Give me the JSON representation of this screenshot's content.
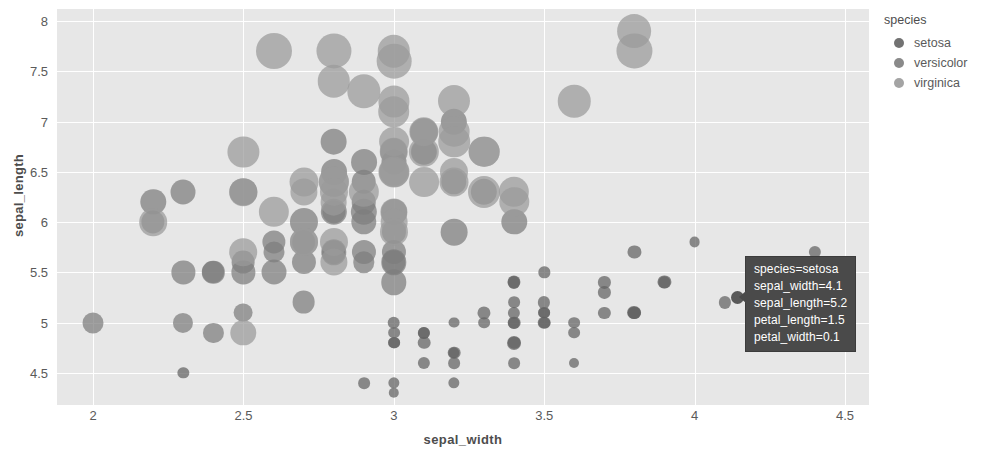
{
  "chart_data": {
    "type": "scatter",
    "title": "",
    "xlabel": "sepal_width",
    "ylabel": "sepal_length",
    "xlim": [
      1.88,
      4.58
    ],
    "ylim": [
      4.18,
      8.12
    ],
    "xticks": [
      "2",
      "2.5",
      "3",
      "3.5",
      "4",
      "4.5"
    ],
    "xtick_values": [
      2,
      2.5,
      3,
      3.5,
      4,
      4.5
    ],
    "yticks": [
      "4.5",
      "5",
      "5.5",
      "6",
      "6.5",
      "7",
      "7.5",
      "8"
    ],
    "ytick_values": [
      4.5,
      5,
      5.5,
      6,
      6.5,
      7,
      7.5,
      8
    ],
    "grid": true,
    "legend_position": "right",
    "size_field": "petal_length",
    "color_field": "species",
    "plot_bgcolor": "#e7e7e7",
    "gridcolor": "#ffffff",
    "series": [
      {
        "name": "setosa",
        "color": "#636363",
        "points": [
          {
            "x": 3.5,
            "y": 5.1,
            "s": 1.4
          },
          {
            "x": 3.0,
            "y": 4.9,
            "s": 1.4
          },
          {
            "x": 3.2,
            "y": 4.7,
            "s": 1.3
          },
          {
            "x": 3.1,
            "y": 4.6,
            "s": 1.5
          },
          {
            "x": 3.6,
            "y": 5.0,
            "s": 1.4
          },
          {
            "x": 3.9,
            "y": 5.4,
            "s": 1.7
          },
          {
            "x": 3.4,
            "y": 4.6,
            "s": 1.4
          },
          {
            "x": 3.4,
            "y": 5.0,
            "s": 1.5
          },
          {
            "x": 2.9,
            "y": 4.4,
            "s": 1.4
          },
          {
            "x": 3.1,
            "y": 4.9,
            "s": 1.5
          },
          {
            "x": 3.7,
            "y": 5.4,
            "s": 1.5
          },
          {
            "x": 3.4,
            "y": 4.8,
            "s": 1.6
          },
          {
            "x": 3.0,
            "y": 4.8,
            "s": 1.4
          },
          {
            "x": 3.0,
            "y": 4.3,
            "s": 1.1
          },
          {
            "x": 4.0,
            "y": 5.8,
            "s": 1.2
          },
          {
            "x": 4.4,
            "y": 5.7,
            "s": 1.5
          },
          {
            "x": 3.9,
            "y": 5.4,
            "s": 1.3
          },
          {
            "x": 3.5,
            "y": 5.1,
            "s": 1.4
          },
          {
            "x": 3.8,
            "y": 5.7,
            "s": 1.7
          },
          {
            "x": 3.8,
            "y": 5.1,
            "s": 1.5
          },
          {
            "x": 3.4,
            "y": 5.4,
            "s": 1.7
          },
          {
            "x": 3.7,
            "y": 5.1,
            "s": 1.5
          },
          {
            "x": 3.6,
            "y": 4.6,
            "s": 1.0
          },
          {
            "x": 3.3,
            "y": 5.1,
            "s": 1.7
          },
          {
            "x": 3.4,
            "y": 4.8,
            "s": 1.9
          },
          {
            "x": 3.0,
            "y": 5.0,
            "s": 1.6
          },
          {
            "x": 3.4,
            "y": 5.0,
            "s": 1.6
          },
          {
            "x": 3.5,
            "y": 5.2,
            "s": 1.5
          },
          {
            "x": 3.4,
            "y": 5.2,
            "s": 1.4
          },
          {
            "x": 3.2,
            "y": 4.7,
            "s": 1.6
          },
          {
            "x": 3.1,
            "y": 4.8,
            "s": 1.6
          },
          {
            "x": 3.4,
            "y": 5.4,
            "s": 1.5
          },
          {
            "x": 4.1,
            "y": 5.2,
            "s": 1.5
          },
          {
            "x": 4.2,
            "y": 5.5,
            "s": 1.4
          },
          {
            "x": 3.1,
            "y": 4.9,
            "s": 1.5
          },
          {
            "x": 3.2,
            "y": 5.0,
            "s": 1.2
          },
          {
            "x": 3.5,
            "y": 5.5,
            "s": 1.3
          },
          {
            "x": 3.6,
            "y": 4.9,
            "s": 1.4
          },
          {
            "x": 3.0,
            "y": 4.4,
            "s": 1.3
          },
          {
            "x": 3.4,
            "y": 5.1,
            "s": 1.5
          },
          {
            "x": 3.5,
            "y": 5.0,
            "s": 1.3
          },
          {
            "x": 2.3,
            "y": 4.5,
            "s": 1.3
          },
          {
            "x": 3.2,
            "y": 4.4,
            "s": 1.3
          },
          {
            "x": 3.5,
            "y": 5.0,
            "s": 1.6
          },
          {
            "x": 3.8,
            "y": 5.1,
            "s": 1.9
          },
          {
            "x": 3.0,
            "y": 4.8,
            "s": 1.4
          },
          {
            "x": 3.8,
            "y": 5.1,
            "s": 1.6
          },
          {
            "x": 3.2,
            "y": 4.6,
            "s": 1.4
          },
          {
            "x": 3.7,
            "y": 5.3,
            "s": 1.5
          },
          {
            "x": 3.3,
            "y": 5.0,
            "s": 1.4
          }
        ]
      },
      {
        "name": "versicolor",
        "color": "#7d7d7d",
        "points": [
          {
            "x": 3.2,
            "y": 7.0,
            "s": 4.7
          },
          {
            "x": 3.2,
            "y": 6.4,
            "s": 4.5
          },
          {
            "x": 3.1,
            "y": 6.9,
            "s": 4.9
          },
          {
            "x": 2.3,
            "y": 5.5,
            "s": 4.0
          },
          {
            "x": 2.8,
            "y": 6.5,
            "s": 4.6
          },
          {
            "x": 2.8,
            "y": 5.7,
            "s": 4.5
          },
          {
            "x": 3.3,
            "y": 6.3,
            "s": 4.7
          },
          {
            "x": 2.4,
            "y": 4.9,
            "s": 3.3
          },
          {
            "x": 2.9,
            "y": 6.6,
            "s": 4.6
          },
          {
            "x": 2.7,
            "y": 5.2,
            "s": 3.9
          },
          {
            "x": 2.0,
            "y": 5.0,
            "s": 3.5
          },
          {
            "x": 3.0,
            "y": 5.9,
            "s": 4.2
          },
          {
            "x": 2.2,
            "y": 6.0,
            "s": 4.0
          },
          {
            "x": 2.9,
            "y": 6.1,
            "s": 4.7
          },
          {
            "x": 2.9,
            "y": 5.6,
            "s": 3.6
          },
          {
            "x": 3.1,
            "y": 6.7,
            "s": 4.4
          },
          {
            "x": 3.0,
            "y": 5.6,
            "s": 4.5
          },
          {
            "x": 2.7,
            "y": 5.8,
            "s": 4.1
          },
          {
            "x": 2.2,
            "y": 6.2,
            "s": 4.5
          },
          {
            "x": 2.5,
            "y": 5.6,
            "s": 3.9
          },
          {
            "x": 3.2,
            "y": 5.9,
            "s": 4.8
          },
          {
            "x": 2.8,
            "y": 6.1,
            "s": 4.0
          },
          {
            "x": 2.5,
            "y": 6.3,
            "s": 4.9
          },
          {
            "x": 2.8,
            "y": 6.1,
            "s": 4.7
          },
          {
            "x": 2.9,
            "y": 6.4,
            "s": 4.3
          },
          {
            "x": 3.0,
            "y": 6.6,
            "s": 4.4
          },
          {
            "x": 2.8,
            "y": 6.8,
            "s": 4.8
          },
          {
            "x": 3.0,
            "y": 6.7,
            "s": 5.0
          },
          {
            "x": 2.9,
            "y": 6.0,
            "s": 4.5
          },
          {
            "x": 2.6,
            "y": 5.7,
            "s": 3.5
          },
          {
            "x": 2.4,
            "y": 5.5,
            "s": 3.8
          },
          {
            "x": 2.4,
            "y": 5.5,
            "s": 3.7
          },
          {
            "x": 2.7,
            "y": 5.8,
            "s": 3.9
          },
          {
            "x": 2.7,
            "y": 6.0,
            "s": 5.1
          },
          {
            "x": 3.0,
            "y": 5.4,
            "s": 4.5
          },
          {
            "x": 3.4,
            "y": 6.0,
            "s": 4.5
          },
          {
            "x": 3.1,
            "y": 6.7,
            "s": 4.7
          },
          {
            "x": 2.3,
            "y": 6.3,
            "s": 4.4
          },
          {
            "x": 3.0,
            "y": 5.6,
            "s": 4.1
          },
          {
            "x": 2.5,
            "y": 5.5,
            "s": 4.0
          },
          {
            "x": 2.6,
            "y": 5.5,
            "s": 4.4
          },
          {
            "x": 3.0,
            "y": 6.1,
            "s": 4.6
          },
          {
            "x": 2.6,
            "y": 5.8,
            "s": 4.0
          },
          {
            "x": 2.3,
            "y": 5.0,
            "s": 3.3
          },
          {
            "x": 2.7,
            "y": 5.6,
            "s": 4.2
          },
          {
            "x": 3.0,
            "y": 5.7,
            "s": 4.2
          },
          {
            "x": 2.9,
            "y": 5.7,
            "s": 4.2
          },
          {
            "x": 2.9,
            "y": 6.2,
            "s": 4.3
          },
          {
            "x": 2.5,
            "y": 5.1,
            "s": 3.0
          },
          {
            "x": 2.8,
            "y": 5.7,
            "s": 4.1
          }
        ]
      },
      {
        "name": "virginica",
        "color": "#9a9a9a",
        "points": [
          {
            "x": 3.3,
            "y": 6.3,
            "s": 6.0
          },
          {
            "x": 2.7,
            "y": 5.8,
            "s": 5.1
          },
          {
            "x": 3.0,
            "y": 7.1,
            "s": 5.9
          },
          {
            "x": 2.9,
            "y": 6.3,
            "s": 5.6
          },
          {
            "x": 3.0,
            "y": 6.5,
            "s": 5.8
          },
          {
            "x": 3.0,
            "y": 7.6,
            "s": 6.6
          },
          {
            "x": 2.5,
            "y": 4.9,
            "s": 4.5
          },
          {
            "x": 2.9,
            "y": 7.3,
            "s": 6.3
          },
          {
            "x": 2.5,
            "y": 6.7,
            "s": 5.8
          },
          {
            "x": 3.6,
            "y": 7.2,
            "s": 6.1
          },
          {
            "x": 3.2,
            "y": 6.5,
            "s": 5.1
          },
          {
            "x": 2.7,
            "y": 6.4,
            "s": 5.3
          },
          {
            "x": 3.0,
            "y": 6.8,
            "s": 5.5
          },
          {
            "x": 2.5,
            "y": 5.7,
            "s": 5.0
          },
          {
            "x": 2.8,
            "y": 5.8,
            "s": 5.1
          },
          {
            "x": 3.2,
            "y": 6.4,
            "s": 5.3
          },
          {
            "x": 3.0,
            "y": 6.5,
            "s": 5.5
          },
          {
            "x": 3.8,
            "y": 7.7,
            "s": 6.7
          },
          {
            "x": 2.6,
            "y": 7.7,
            "s": 6.9
          },
          {
            "x": 2.2,
            "y": 6.0,
            "s": 5.0
          },
          {
            "x": 3.2,
            "y": 6.9,
            "s": 5.7
          },
          {
            "x": 2.8,
            "y": 5.6,
            "s": 4.9
          },
          {
            "x": 2.8,
            "y": 7.7,
            "s": 6.7
          },
          {
            "x": 2.7,
            "y": 6.3,
            "s": 4.9
          },
          {
            "x": 3.3,
            "y": 6.7,
            "s": 5.7
          },
          {
            "x": 3.2,
            "y": 7.2,
            "s": 6.0
          },
          {
            "x": 2.8,
            "y": 6.2,
            "s": 4.8
          },
          {
            "x": 3.0,
            "y": 6.1,
            "s": 4.9
          },
          {
            "x": 2.8,
            "y": 6.4,
            "s": 5.6
          },
          {
            "x": 3.0,
            "y": 7.2,
            "s": 5.8
          },
          {
            "x": 2.8,
            "y": 7.4,
            "s": 6.1
          },
          {
            "x": 3.8,
            "y": 7.9,
            "s": 6.4
          },
          {
            "x": 2.8,
            "y": 6.4,
            "s": 5.6
          },
          {
            "x": 2.8,
            "y": 6.3,
            "s": 5.1
          },
          {
            "x": 2.6,
            "y": 6.1,
            "s": 5.6
          },
          {
            "x": 3.0,
            "y": 7.7,
            "s": 6.1
          },
          {
            "x": 3.4,
            "y": 6.3,
            "s": 5.6
          },
          {
            "x": 3.1,
            "y": 6.4,
            "s": 5.5
          },
          {
            "x": 3.0,
            "y": 6.0,
            "s": 4.8
          },
          {
            "x": 3.1,
            "y": 6.9,
            "s": 5.4
          },
          {
            "x": 3.1,
            "y": 6.7,
            "s": 5.6
          },
          {
            "x": 3.1,
            "y": 6.9,
            "s": 5.1
          },
          {
            "x": 2.7,
            "y": 5.8,
            "s": 5.1
          },
          {
            "x": 3.2,
            "y": 6.8,
            "s": 5.9
          },
          {
            "x": 3.3,
            "y": 6.7,
            "s": 5.7
          },
          {
            "x": 3.0,
            "y": 6.7,
            "s": 5.2
          },
          {
            "x": 2.5,
            "y": 6.3,
            "s": 5.0
          },
          {
            "x": 3.0,
            "y": 6.5,
            "s": 5.2
          },
          {
            "x": 3.4,
            "y": 6.2,
            "s": 5.4
          },
          {
            "x": 3.0,
            "y": 5.9,
            "s": 5.1
          }
        ]
      }
    ]
  },
  "legend": {
    "title": "species",
    "items": [
      {
        "label": "setosa",
        "color": "#636363"
      },
      {
        "label": "versicolor",
        "color": "#7d7d7d"
      },
      {
        "label": "virginica",
        "color": "#9a9a9a"
      }
    ]
  },
  "tooltip": {
    "lines": [
      "species=setosa",
      "sepal_width=4.1",
      "sepal_length=5.2",
      "petal_length=1.5",
      "petal_width=0.1"
    ]
  }
}
